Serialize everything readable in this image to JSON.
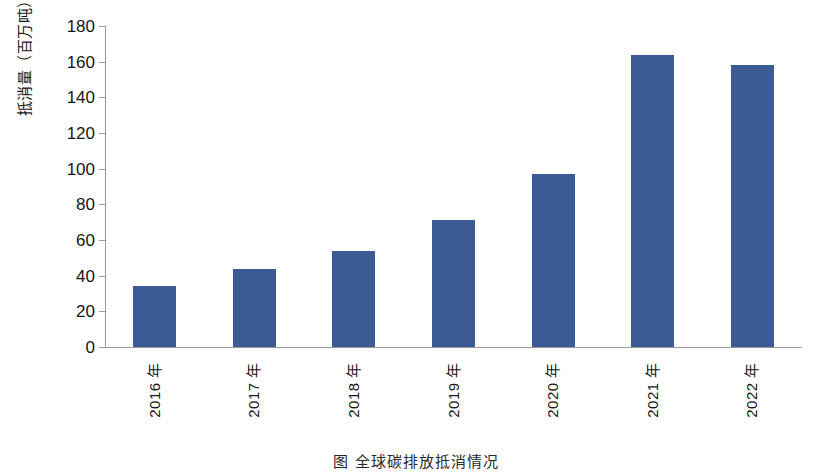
{
  "chart_data": {
    "type": "bar",
    "title": "",
    "xlabel": "",
    "ylabel": "抵消量（百万吨）",
    "categories": [
      "2016 年",
      "2017 年",
      "2018 年",
      "2019 年",
      "2020 年",
      "2021 年",
      "2022 年"
    ],
    "values": [
      34,
      44,
      54,
      71,
      97,
      164,
      158
    ],
    "ylim": [
      0,
      180
    ],
    "yticks": [
      0,
      20,
      40,
      60,
      80,
      100,
      120,
      140,
      160,
      180
    ],
    "ytick_labels": [
      "0",
      "20",
      "40",
      "60",
      "80",
      "100",
      "120",
      "140",
      "160",
      "180"
    ],
    "grid": false,
    "legend": null,
    "series": [
      {
        "name": "抵消量",
        "values": [
          34,
          44,
          54,
          71,
          97,
          164,
          158
        ],
        "color": "#3c5a94"
      }
    ]
  },
  "figure": {
    "caption": "图       全球碳排放抵消情况",
    "bar_color": "#3c5a94",
    "axis_color": "#9a9a9a",
    "background": "#ffffff"
  }
}
